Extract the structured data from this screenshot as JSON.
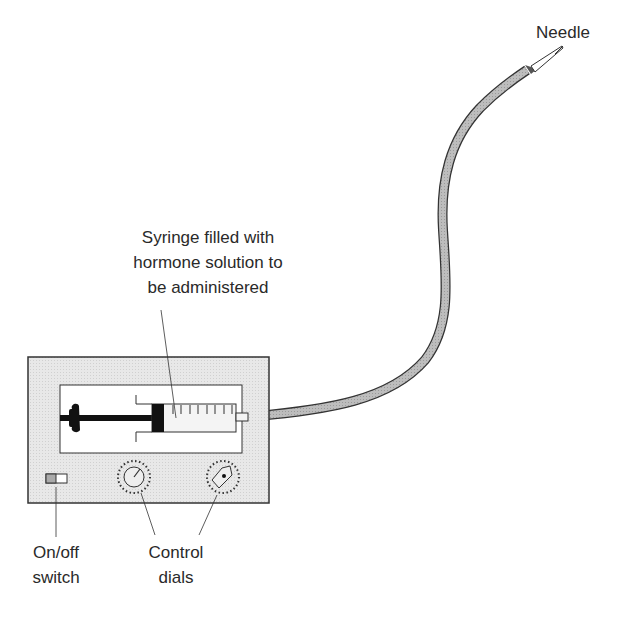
{
  "diagram": {
    "type": "labeled-illustration",
    "labels": {
      "needle": "Needle",
      "syringe_line1": "Syringe filled with",
      "syringe_line2": "hormone solution to",
      "syringe_line3": "be administered",
      "switch_line1": "On/off",
      "switch_line2": "switch",
      "dials_line1": "Control",
      "dials_line2": "dials"
    },
    "colors": {
      "housing_fill": "#e6e6e6",
      "tube_fill": "#b8b8b8",
      "outline": "#333333",
      "plunger": "#111111",
      "text": "#2a2a2a"
    }
  }
}
